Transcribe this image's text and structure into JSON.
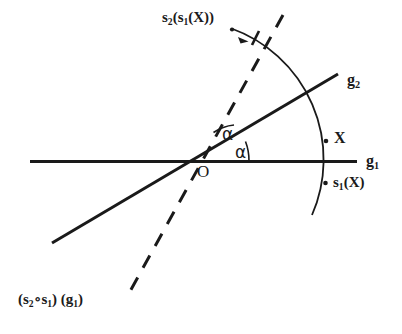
{
  "figure": {
    "background_color": "#ffffff",
    "ink_color": "#1a1a1a",
    "labels": {
      "origin": "O",
      "line_g1": "g",
      "line_g1_sub": "1",
      "line_g2": "g",
      "line_g2_sub": "2",
      "point_x": "X",
      "point_s1x_main": "s",
      "point_s1x_sub": "1",
      "point_s1x_tail": "(X)",
      "point_s2s1x_main": "s",
      "point_s2s1x_sub1": "2",
      "point_s2s1x_mid": "(s",
      "point_s2s1x_sub2": "1",
      "point_s2s1x_tail": "(X))",
      "angle_upper": "α",
      "angle_lower": "α",
      "bottom_open": "(s",
      "bottom_sub1": "2",
      "bottom_ring": "∘s",
      "bottom_sub2": "1",
      "bottom_close": ") (g",
      "bottom_sub3": "1",
      "bottom_end": ")"
    },
    "elements": [
      {
        "name": "line-g1",
        "kind": "solid-line",
        "style": "horizontal mirror axis"
      },
      {
        "name": "line-g2",
        "kind": "solid-line",
        "style": "oblique mirror axis"
      },
      {
        "name": "image-line",
        "kind": "dashed-line",
        "style": "image of g1 under composition"
      },
      {
        "name": "orbit-arc",
        "kind": "arc",
        "style": "circular arc through X, s1(X), s2(s1(X))"
      },
      {
        "name": "angle-mark-upper",
        "kind": "angle-arc"
      },
      {
        "name": "angle-mark-lower",
        "kind": "angle-arc"
      },
      {
        "name": "rotation-arrow",
        "kind": "arrowhead"
      }
    ]
  }
}
